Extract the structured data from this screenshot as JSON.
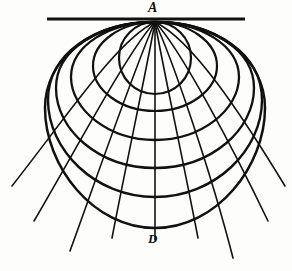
{
  "figure": {
    "kind": "geometric-projection-diagram",
    "title": "",
    "background_color": "#fdfdfb",
    "ink_color": "#111111",
    "width": 292,
    "height": 271,
    "labels": [
      {
        "id": "A",
        "text": "A",
        "x": 155,
        "y": 10,
        "role": "apex-pole-point"
      },
      {
        "id": "D",
        "text": "D",
        "x": 155,
        "y": 240,
        "role": "meridian-foot-point"
      }
    ],
    "apex": {
      "x": 155,
      "y": 22
    },
    "horizon_line": {
      "name": "horizon-line",
      "x1": 47,
      "y1": 19,
      "x2": 245,
      "y2": 19,
      "stroke_width": 2.6
    },
    "meridian_tick": {
      "name": "meridian-foot-tick",
      "x1": 144,
      "y1": 228,
      "x2": 166,
      "y2": 228,
      "stroke_width": 1.1
    },
    "parallels": [
      {
        "name": "parallel-1",
        "cx": 155,
        "cy": 58,
        "rx": 36,
        "ry": 36,
        "stroke_width": 2.2
      },
      {
        "name": "parallel-2",
        "cx": 155,
        "cy": 66,
        "rx": 62,
        "ry": 45,
        "stroke_width": 2.2
      },
      {
        "name": "parallel-3",
        "cx": 155,
        "cy": 76,
        "rx": 84,
        "ry": 64,
        "stroke_width": 2.3
      },
      {
        "name": "parallel-4",
        "cx": 155,
        "cy": 86,
        "rx": 99,
        "ry": 82,
        "stroke_width": 2.3
      },
      {
        "name": "parallel-5",
        "cx": 155,
        "cy": 96,
        "rx": 107,
        "ry": 101,
        "stroke_width": 2.4
      },
      {
        "name": "parallel-6",
        "cx": 155,
        "cy": 104,
        "rx": 110,
        "ry": 124,
        "stroke_width": 2.5
      }
    ],
    "meridians": [
      {
        "name": "meridian-left-5",
        "end_x": 12,
        "end_y": 186,
        "curve": true
      },
      {
        "name": "meridian-left-4",
        "end_x": 34,
        "end_y": 221,
        "curve": true
      },
      {
        "name": "meridian-left-3",
        "end_x": 70,
        "end_y": 251,
        "curve": true
      },
      {
        "name": "meridian-left-2",
        "end_x": 112,
        "end_y": 238,
        "curve": true
      },
      {
        "name": "meridian-center",
        "end_x": 155,
        "end_y": 240,
        "curve": false
      },
      {
        "name": "meridian-right-2",
        "end_x": 198,
        "end_y": 238,
        "curve": true
      },
      {
        "name": "meridian-right-3",
        "end_x": 233,
        "end_y": 258,
        "curve": true
      },
      {
        "name": "meridian-right-4",
        "end_x": 268,
        "end_y": 221,
        "curve": true
      },
      {
        "name": "meridian-right-5",
        "end_x": 285,
        "end_y": 186,
        "curve": true
      }
    ]
  }
}
